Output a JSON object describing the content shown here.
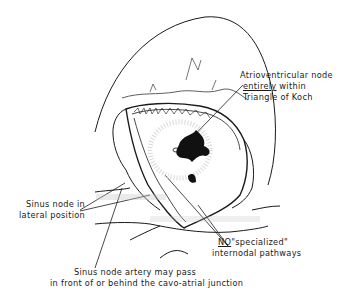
{
  "labels": {
    "av_node": {
      "line1": "Atrioventricular node",
      "line2_underlined": "entirely",
      "line2_rest": " within",
      "line3": "Triangle of Koch"
    },
    "sinus_node": {
      "line1": "Sinus node in",
      "line2": "lateral position"
    },
    "internodal": {
      "line1_underlined": "NO",
      "line1_rest": "\"specialized\"",
      "line2": "internodal pathways"
    },
    "artery": {
      "line1": "Sinus node artery may pass",
      "line2": "in front of or behind the cavo-atrial junction"
    }
  },
  "colors": {
    "ink": "#1a1a1a",
    "shading": "#c8c8c8",
    "background": "#ffffff"
  }
}
